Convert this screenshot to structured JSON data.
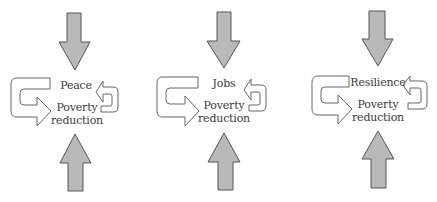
{
  "diagram": {
    "colors": {
      "block_arrow_fill": "#b9b9b9",
      "block_arrow_stroke": "#555555",
      "loop_arrow_fill": "#ffffff",
      "loop_arrow_stroke": "#666666",
      "text": "#3a3a3a"
    },
    "panels": [
      {
        "id": "peace",
        "top_label": "Peace",
        "bottom_label_line1": "Poverty",
        "bottom_label_line2": "reduction"
      },
      {
        "id": "jobs",
        "top_label": "Jobs",
        "bottom_label_line1": "Poverty",
        "bottom_label_line2": "reduction"
      },
      {
        "id": "resilience",
        "top_label": "Resilience",
        "bottom_label_line1": "Poverty",
        "bottom_label_line2": "reduction"
      }
    ],
    "icons": {
      "top_arrow": "down-arrow-icon",
      "bottom_arrow": "up-arrow-icon",
      "left_loop": "u-turn-right-arrow-icon",
      "right_loop": "u-turn-left-arrow-icon"
    }
  }
}
